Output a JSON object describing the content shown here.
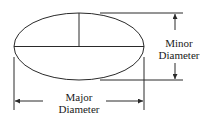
{
  "diagram": {
    "type": "ellipse-dimension-drawing",
    "minor_label": {
      "line1": "Minor",
      "line2": "Diameter"
    },
    "major_label": {
      "line1": "Major",
      "line2": "Diameter"
    },
    "stroke_color": "#2a2a2a",
    "background": "#ffffff"
  }
}
